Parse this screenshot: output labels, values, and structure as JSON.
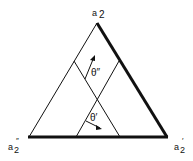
{
  "diagram": {
    "type": "ternary-triangle",
    "vertices": {
      "top": {
        "label": "a",
        "sub": "2",
        "mark": ""
      },
      "bottom_left": {
        "label": "a",
        "sub": "2",
        "mark": "″"
      },
      "bottom_right": {
        "label": "a",
        "sub": "2",
        "mark": "′"
      }
    },
    "angles": [
      {
        "label": "θ″"
      },
      {
        "label": "θ′"
      }
    ],
    "colors": {
      "line": "#111111",
      "background": "#ffffff"
    }
  }
}
